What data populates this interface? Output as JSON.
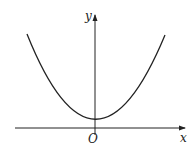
{
  "figure": {
    "labels": {
      "y_axis": "y",
      "x_axis": "x",
      "origin": "O"
    },
    "colors": {
      "background": "#ffffff",
      "stroke": "#222222"
    },
    "curve": {
      "type": "parabola",
      "opens": "up",
      "vertex": "on positive y-axis, just above x-axis",
      "symmetric_about": "y-axis"
    }
  }
}
